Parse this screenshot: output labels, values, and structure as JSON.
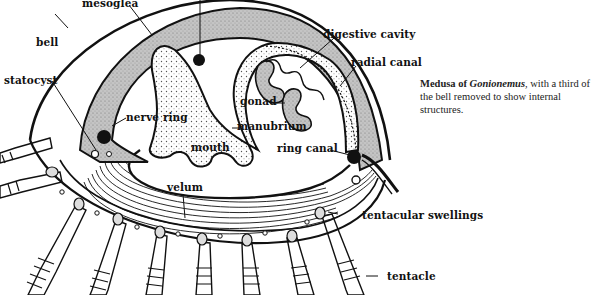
{
  "diagram": {
    "subject": "Medusa of Gonionemus",
    "caption": {
      "lead": "Medusa of ",
      "genus": "Gonionemus",
      "rest": ", with a third of the bell removed to show internal structures."
    },
    "labels": {
      "mesoglea": "mesoglea",
      "bell": "bell",
      "statocyst": "statocyst",
      "nerve_ring": "nerve ring",
      "digestive_cavity": "digestive cavity",
      "radial_canal": "radial canal",
      "gonad": "gonad",
      "manubrium": "manubrium",
      "mouth": "mouth",
      "ring_canal": "ring canal",
      "velum": "velum",
      "tentacular_swellings": "tentacular swellings",
      "tentacle": "tentacle"
    },
    "colors": {
      "ink": "#111111",
      "mesoglea_fill": "#b8b8b8",
      "background": "#ffffff"
    }
  }
}
